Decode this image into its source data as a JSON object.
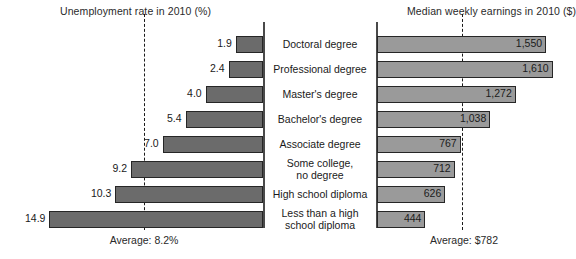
{
  "chart_data": {
    "type": "bar",
    "title": "",
    "layout": "bidirectional paired horizontal bar chart (left: unemployment rate, right: median weekly earnings), categories listed in center column",
    "categories": [
      "Doctoral degree",
      "Professional degree",
      "Master's degree",
      "Bachelor's degree",
      "Associate degree",
      "Some college,\nno degree",
      "High school diploma",
      "Less than a high\nschool diploma"
    ],
    "series": [
      {
        "name": "Unemployment rate in 2010 (%)",
        "side": "left",
        "unit": "%",
        "values": [
          1.9,
          2.4,
          4.0,
          5.4,
          7.0,
          9.2,
          10.3,
          14.9
        ],
        "value_labels": [
          "1.9",
          "2.4",
          "4.0",
          "5.4",
          "7.0",
          "9.2",
          "10.3",
          "14.9"
        ],
        "average": 8.2,
        "average_label": "Average: 8.2%",
        "axis_max": 15.0,
        "bar_color": "#6b6b6b"
      },
      {
        "name": "Median weekly earnings in 2010 ($)",
        "side": "right",
        "unit": "$",
        "values": [
          1550,
          1610,
          1272,
          1038,
          767,
          712,
          626,
          444
        ],
        "value_labels": [
          "1,550",
          "1,610",
          "1,272",
          "1,038",
          "767",
          "712",
          "626",
          "444"
        ],
        "average": 782,
        "average_label": "Average: $782",
        "axis_max": 1650,
        "bar_color": "#9a9a9a"
      }
    ],
    "grid": false,
    "legend": "none",
    "axis_color": "#4a4a4a",
    "dashed_line_color": "#1a1a1a"
  },
  "titles": {
    "left": "Unemployment rate in 2010 (%)",
    "right": "Median weekly earnings in 2010 ($)"
  },
  "averages": {
    "left": "Average: 8.2%",
    "right": "Average: $782"
  }
}
